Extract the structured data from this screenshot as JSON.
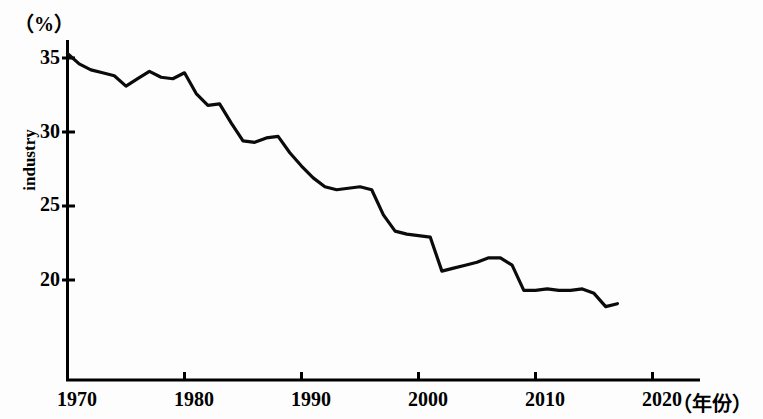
{
  "chart_data": {
    "type": "line",
    "title": "",
    "subtitle": "",
    "unit_label": "（%）",
    "ylabel": "industry",
    "xlabel": "（年份）",
    "xlim": [
      1970,
      2020
    ],
    "ylim": [
      17.6,
      35.6
    ],
    "yticks": [
      20,
      25,
      30,
      35
    ],
    "xticks": [
      1970,
      1980,
      1990,
      2000,
      2010,
      2020
    ],
    "grid": false,
    "legend": null,
    "series": [
      {
        "name": "industry",
        "x": [
          1970,
          1971,
          1972,
          1973,
          1974,
          1975,
          1976,
          1977,
          1978,
          1979,
          1980,
          1981,
          1982,
          1983,
          1984,
          1985,
          1986,
          1987,
          1988,
          1989,
          1990,
          1991,
          1992,
          1993,
          1994,
          1995,
          1996,
          1997,
          1998,
          1999,
          2000,
          2001,
          2002,
          2003,
          2004,
          2005,
          2006,
          2007,
          2008,
          2009,
          2010,
          2011,
          2012,
          2013,
          2014,
          2015,
          2016,
          2017
        ],
        "values": [
          35.3,
          34.6,
          34.2,
          34.0,
          33.8,
          33.1,
          33.6,
          34.1,
          33.7,
          33.6,
          34.0,
          32.6,
          31.8,
          31.9,
          30.6,
          29.4,
          29.3,
          29.6,
          29.7,
          28.6,
          27.7,
          26.9,
          26.3,
          26.1,
          26.2,
          26.3,
          26.1,
          24.4,
          23.3,
          23.1,
          23.0,
          22.9,
          20.6,
          20.8,
          21.0,
          21.2,
          21.5,
          21.5,
          21.0,
          19.3,
          19.3,
          19.4,
          19.3,
          19.3,
          19.4,
          19.1,
          18.2,
          18.4
        ]
      }
    ]
  },
  "axis": {
    "ytick_labels": [
      "35",
      "30",
      "25",
      "20"
    ],
    "xtick_labels": [
      "1970",
      "1980",
      "1990",
      "2000",
      "2010",
      "2020"
    ]
  }
}
